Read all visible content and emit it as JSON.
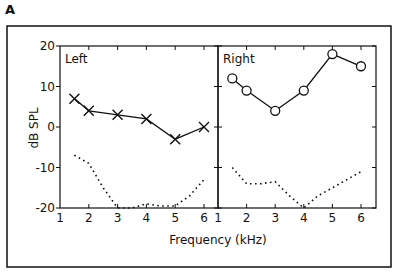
{
  "figure": {
    "panel_label": "A",
    "panel_label_next": "B"
  },
  "chart_data": [
    {
      "type": "line",
      "title": "Left",
      "xlabel": "Frequency (kHz)",
      "ylabel": "dB SPL",
      "xlim": [
        1,
        6.5
      ],
      "ylim": [
        -20,
        20
      ],
      "x_ticks": [
        "1",
        "2",
        "3",
        "4",
        "5",
        "6"
      ],
      "y_ticks": [
        "20",
        "10",
        "0",
        "-10",
        "-20"
      ],
      "grid": false,
      "series": [
        {
          "name": "Left threshold",
          "marker": "x",
          "line": "solid",
          "x": [
            1.5,
            2,
            3,
            4,
            5,
            6
          ],
          "values": [
            7,
            4,
            3,
            2,
            -3,
            0
          ]
        },
        {
          "name": "Left reference",
          "marker": "none",
          "line": "dotted",
          "x": [
            1.5,
            2,
            2.5,
            3,
            3.5,
            4,
            4.5,
            5,
            5.5,
            6
          ],
          "values": [
            -7,
            -9,
            -15,
            -20,
            -20,
            -19,
            -19.5,
            -19.5,
            -17,
            -13
          ]
        }
      ]
    },
    {
      "type": "line",
      "title": "Right",
      "xlabel": "Frequency (kHz)",
      "ylabel": "dB SPL",
      "xlim": [
        1,
        6.5
      ],
      "ylim": [
        -20,
        20
      ],
      "x_ticks": [
        "1",
        "2",
        "3",
        "4",
        "5",
        "6"
      ],
      "grid": false,
      "series": [
        {
          "name": "Right threshold",
          "marker": "o",
          "line": "solid",
          "x": [
            1.5,
            2,
            3,
            4,
            5,
            6
          ],
          "values": [
            12,
            9,
            4,
            9,
            18,
            15
          ]
        },
        {
          "name": "Right reference",
          "marker": "none",
          "line": "dotted",
          "x": [
            1.5,
            2,
            2.5,
            3,
            3.5,
            4,
            4.5,
            5,
            5.5,
            6
          ],
          "values": [
            -10,
            -14,
            -14,
            -13.5,
            -17,
            -20,
            -17,
            -15,
            -13,
            -11
          ]
        }
      ]
    }
  ]
}
